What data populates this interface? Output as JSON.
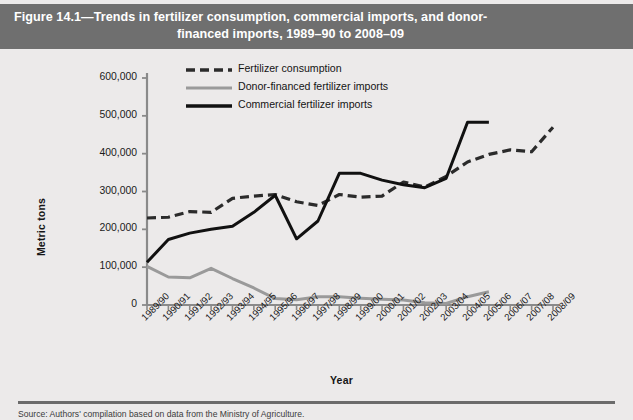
{
  "figure": {
    "title_line1": "Figure 14.1—Trends in fertilizer consumption, commercial imports, and donor-",
    "title_line2": "financed imports, 1989–90 to 2008–09",
    "source_note": "Source: Authors' compilation based on data from the Ministry of Agriculture.",
    "title_bar_color": "#6f6f6f",
    "panel_color": "#eceaea"
  },
  "chart_data": {
    "type": "line",
    "xlabel": "Year",
    "ylabel": "Metric tons",
    "ylim": [
      0,
      600000
    ],
    "yticks": [
      0,
      100000,
      200000,
      300000,
      400000,
      500000,
      600000
    ],
    "ytick_labels": [
      "0",
      "100,000",
      "200,000",
      "300,000",
      "400,000",
      "500,000",
      "600,000"
    ],
    "grid": false,
    "legend_position": "top-center",
    "categories": [
      "1989/90",
      "1990/91",
      "1991/92",
      "1992/93",
      "1993/94",
      "1994/95",
      "1995/96",
      "1996/97",
      "1997/98",
      "1998/99",
      "1999/00",
      "2000/01",
      "2001/02",
      "2002/03",
      "2003/04",
      "2004/05",
      "2005/06",
      "2006/07",
      "2007/08",
      "2008/09"
    ],
    "series": [
      {
        "name": "Fertilizer consumption",
        "style": "dashed",
        "color": "#2b2b2b",
        "values": [
          230000,
          232000,
          247000,
          245000,
          282000,
          288000,
          292000,
          273000,
          263000,
          292000,
          285000,
          288000,
          325000,
          312000,
          340000,
          378000,
          398000,
          410000,
          405000,
          470000
        ]
      },
      {
        "name": "Donor-financed fertilizer imports",
        "style": "solid",
        "color": "#9a9a9a",
        "values": [
          102000,
          74000,
          72000,
          97000,
          70000,
          45000,
          17000,
          14000,
          22000,
          22000,
          18000,
          15000,
          13000,
          6000,
          4000,
          22000,
          35000,
          null,
          null,
          null
        ]
      },
      {
        "name": "Commercial fertilizer imports",
        "style": "solid-bold",
        "color": "#111111",
        "values": [
          113000,
          173000,
          190000,
          200000,
          208000,
          245000,
          290000,
          175000,
          222000,
          348000,
          348000,
          330000,
          318000,
          310000,
          335000,
          483000,
          483000,
          null,
          null,
          null
        ]
      }
    ]
  },
  "legend": {
    "items": [
      {
        "label": "Fertilizer consumption",
        "marker": "dashed-black"
      },
      {
        "label": "Donor-financed fertilizer imports",
        "marker": "solid-gray"
      },
      {
        "label": "Commercial fertilizer imports",
        "marker": "solid-black"
      }
    ]
  }
}
